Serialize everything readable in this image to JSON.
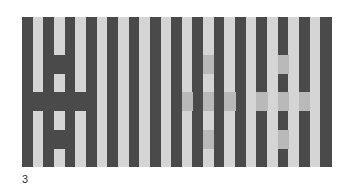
{
  "figure": {
    "label": "3",
    "origin": {
      "x": 22,
      "y": 17
    },
    "width": 309,
    "height": 150,
    "stripe_count": 29,
    "row_count": 8,
    "colors": {
      "dark": "#4a4a4a",
      "light": "#d5d5d5",
      "medium": "#b9b9b9"
    },
    "first_stripe": "dark",
    "crosses": [
      {
        "name": "left-cross",
        "description": "light stripes darkened",
        "fill": "dark",
        "band_stripes": [
          1,
          3,
          5
        ],
        "center_stripe": 3,
        "center_rows": [
          2,
          6
        ],
        "band_row": 4
      },
      {
        "name": "middle-cross",
        "description": "light stripes tinted medium gray",
        "fill": "medium",
        "band_stripes": [
          15,
          17,
          19
        ],
        "center_stripe": 17,
        "center_rows": [
          2,
          6
        ],
        "band_row": 4
      },
      {
        "name": "right-cross",
        "description": "dark stripes tinted medium gray",
        "fill": "medium",
        "band_stripes": [
          22,
          24,
          26
        ],
        "center_stripe": 24,
        "center_rows": [
          2,
          6
        ],
        "band_row": 4
      }
    ]
  }
}
